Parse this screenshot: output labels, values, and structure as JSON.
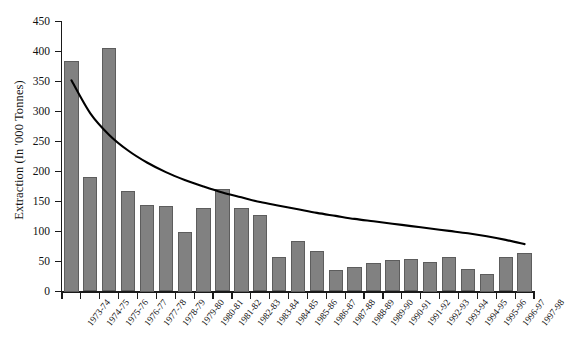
{
  "chart_data": {
    "type": "bar",
    "title": "",
    "xlabel": "",
    "ylabel": "Extraction (In '000 Tonnes)",
    "ylim": [
      0,
      450
    ],
    "ytick_step": 50,
    "yticks": [
      0,
      50,
      100,
      150,
      200,
      250,
      300,
      350,
      400,
      450
    ],
    "ytick_labels": [
      "0",
      "50",
      "100",
      "150",
      "200",
      "250",
      "300",
      "350",
      "400",
      "450"
    ],
    "grid": false,
    "legend": "none",
    "bar_color": "#818181",
    "bar_edge_color": "#5d5d5d",
    "trend_color": "#000000",
    "categories": [
      "1973-74",
      "1974-75",
      "1975-76",
      "1976-77",
      "1977-78",
      "1978-79",
      "1979-80",
      "1980-81",
      "1981-82",
      "1982-83",
      "1983-84",
      "1984-85",
      "1985-86",
      "1986-87",
      "1987-88",
      "1988-89",
      "1989-90",
      "1990-91",
      "1991-92",
      "1992-93",
      "1993-94",
      "1994-95",
      "1995-96",
      "1996-97",
      "1997-98"
    ],
    "values": [
      385,
      191,
      406,
      168,
      145,
      143,
      100,
      140,
      171,
      140,
      127,
      57,
      85,
      67,
      36,
      41,
      47,
      53,
      54,
      50,
      57,
      38,
      30,
      57,
      65
    ],
    "series": [
      {
        "name": "Extraction",
        "type": "bar",
        "values": [
          385,
          191,
          406,
          168,
          145,
          143,
          100,
          140,
          171,
          140,
          127,
          57,
          85,
          67,
          36,
          41,
          47,
          53,
          54,
          50,
          57,
          38,
          30,
          57,
          65
        ]
      },
      {
        "name": "Trend",
        "type": "line",
        "values": [
          352,
          297,
          261,
          235,
          215,
          199,
          186,
          175,
          165,
          157,
          149,
          143,
          137,
          131,
          126,
          121,
          117,
          113,
          109,
          105,
          101,
          97,
          92,
          86,
          79
        ]
      }
    ]
  }
}
